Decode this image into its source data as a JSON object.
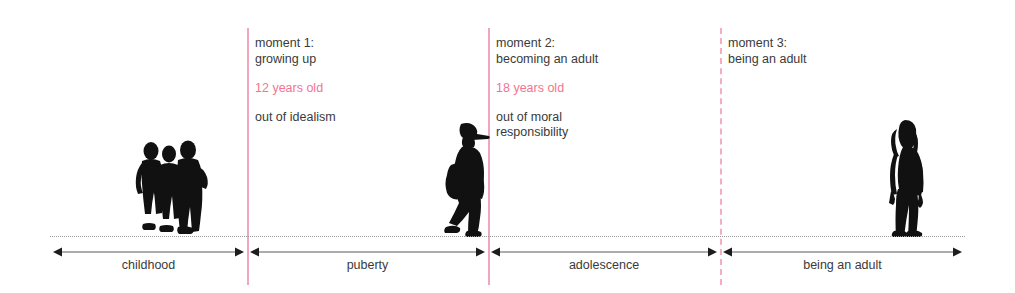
{
  "diagram": {
    "background_color": "#ffffff",
    "accent_color": "#f2758f",
    "line_color": "#f2a6bb",
    "text_color": "#3a3a3a",
    "axis_color": "#5a5a5a",
    "ground_color": "#9a9a9a"
  },
  "moments": [
    {
      "id": "moment-1",
      "title": "moment 1:\ngrowing up",
      "age": "12 years old",
      "description": "out of idealism",
      "line_style": "solid",
      "x": 247
    },
    {
      "id": "moment-2",
      "title": "moment 2:\nbecoming an adult",
      "age": "18 years old",
      "description": "out of moral\nresponsibility",
      "line_style": "solid",
      "x": 488
    },
    {
      "id": "moment-3",
      "title": "moment 3:\nbeing an adult",
      "age": "",
      "description": "",
      "line_style": "dashed",
      "x": 720
    }
  ],
  "stages": [
    {
      "id": "stage-childhood",
      "label": "childhood",
      "start": 50,
      "end": 247,
      "arrow_left": true,
      "arrow_right": true
    },
    {
      "id": "stage-puberty",
      "label": "puberty",
      "start": 247,
      "end": 488,
      "arrow_left": true,
      "arrow_right": true
    },
    {
      "id": "stage-adolescence",
      "label": "adolescence",
      "start": 488,
      "end": 720,
      "arrow_left": true,
      "arrow_right": true
    },
    {
      "id": "stage-adulthood",
      "label": "being an adult",
      "start": 720,
      "end": 965,
      "arrow_left": true,
      "arrow_right": true
    }
  ],
  "figures": [
    {
      "id": "figure-children",
      "name": "group of three children silhouette",
      "x": 131,
      "y": 139,
      "width": 78,
      "height": 99
    },
    {
      "id": "figure-teenager",
      "name": "teenager with cap and backpack silhouette",
      "x": 437,
      "y": 121,
      "width": 56,
      "height": 117
    },
    {
      "id": "figure-adult",
      "name": "adult woman standing silhouette",
      "x": 881,
      "y": 119,
      "width": 48,
      "height": 119
    }
  ]
}
